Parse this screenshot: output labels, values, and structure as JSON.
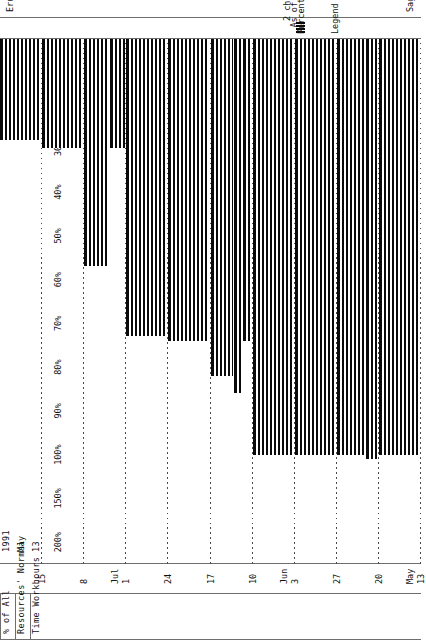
{
  "report": {
    "product": "Sagacity 1.00",
    "copyright": "Erudite Corporation (c) 1990"
  },
  "row_headers": [
    "% of All",
    "Resources' Normal",
    "Time Workhours"
  ],
  "period_header": {
    "year": "1991",
    "month": "May",
    "day": "13"
  },
  "legend": {
    "title": "Legend :",
    "swatch_name": "hatch-swatch",
    "items": [
      "Percentage Utilization",
      "As of Date (02/07/91)",
      "2 characters (|) represent 1 day"
    ]
  },
  "chart_data": {
    "type": "bar",
    "title": "Percentage Utilization",
    "xlabel": "",
    "ylabel": "% of All Resources' Normal Time Workhours",
    "grid": true,
    "orientation": "horizontal",
    "legend_position": "bottom-right",
    "categories": [
      "May 13",
      "May 20",
      "May 27",
      "Jun 3",
      "Jun 10",
      "Jun 17",
      "Jun 24",
      "Jul 1",
      "Jul 8",
      "Jul 15"
    ],
    "tick_labels": [
      "13",
      "20",
      "27",
      "3",
      "10",
      "17",
      "24",
      "1",
      "8",
      "15"
    ],
    "month_labels": [
      "May",
      "",
      "",
      "Jun",
      "",
      "",
      "",
      "Jul",
      "",
      ""
    ],
    "scale_ticks": [
      "200%",
      "150%",
      "100%",
      "90%",
      "80%",
      "70%",
      "60%",
      "50%",
      "40%",
      "30%",
      "20%",
      "10%"
    ],
    "scale_values": [
      200,
      150,
      100,
      90,
      80,
      70,
      60,
      50,
      40,
      30,
      20,
      10
    ],
    "values": [
      100,
      105,
      100,
      100,
      82,
      74,
      73,
      57,
      30,
      30
    ],
    "sub_steps": [
      {
        "week": "May 13",
        "steps": [
          {
            "from": 0,
            "to": 100,
            "value": 100
          }
        ]
      },
      {
        "week": "May 20",
        "steps": [
          {
            "from": 0,
            "to": 70,
            "value": 100
          },
          {
            "from": 70,
            "to": 100,
            "value": 105
          }
        ]
      },
      {
        "week": "May 27",
        "steps": [
          {
            "from": 0,
            "to": 100,
            "value": 100
          }
        ]
      },
      {
        "week": "Jun 3",
        "steps": [
          {
            "from": 0,
            "to": 100,
            "value": 100
          }
        ]
      },
      {
        "week": "Jun 10",
        "steps": [
          {
            "from": 0,
            "to": 55,
            "value": 82
          },
          {
            "from": 55,
            "to": 78,
            "value": 86
          },
          {
            "from": 78,
            "to": 100,
            "value": 74
          }
        ]
      },
      {
        "week": "Jun 17",
        "steps": [
          {
            "from": 0,
            "to": 100,
            "value": 74
          }
        ]
      },
      {
        "week": "Jun 24",
        "steps": [
          {
            "from": 0,
            "to": 100,
            "value": 73
          }
        ]
      },
      {
        "week": "Jul 1",
        "steps": [
          {
            "from": 0,
            "to": 62,
            "value": 57
          },
          {
            "from": 62,
            "to": 100,
            "value": 30
          }
        ]
      },
      {
        "week": "Jul 8",
        "steps": [
          {
            "from": 0,
            "to": 100,
            "value": 30
          }
        ]
      },
      {
        "week": "Jul 15",
        "steps": [
          {
            "from": 0,
            "to": 100,
            "value": 28
          }
        ]
      }
    ],
    "ylim": [
      0,
      200
    ]
  }
}
